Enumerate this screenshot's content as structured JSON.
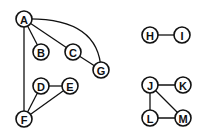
{
  "diagram": {
    "type": "undirected-graph",
    "node_radius": 8,
    "nodes": [
      {
        "id": "A",
        "label": "A",
        "x": 24,
        "y": 19
      },
      {
        "id": "B",
        "label": "B",
        "x": 41,
        "y": 52
      },
      {
        "id": "C",
        "label": "C",
        "x": 73,
        "y": 52
      },
      {
        "id": "G",
        "label": "G",
        "x": 101,
        "y": 70
      },
      {
        "id": "D",
        "label": "D",
        "x": 41,
        "y": 86
      },
      {
        "id": "E",
        "label": "E",
        "x": 70,
        "y": 86
      },
      {
        "id": "F",
        "label": "F",
        "x": 24,
        "y": 119
      },
      {
        "id": "H",
        "label": "H",
        "x": 150,
        "y": 35
      },
      {
        "id": "I",
        "label": "I",
        "x": 182,
        "y": 35
      },
      {
        "id": "J",
        "label": "J",
        "x": 150,
        "y": 85
      },
      {
        "id": "K",
        "label": "K",
        "x": 183,
        "y": 85
      },
      {
        "id": "L",
        "label": "L",
        "x": 150,
        "y": 118
      },
      {
        "id": "M",
        "label": "M",
        "x": 183,
        "y": 118
      }
    ],
    "edges": [
      {
        "from": "A",
        "to": "B"
      },
      {
        "from": "A",
        "to": "C"
      },
      {
        "from": "C",
        "to": "G"
      },
      {
        "from": "A",
        "to": "G",
        "curved": true
      },
      {
        "from": "A",
        "to": "F"
      },
      {
        "from": "D",
        "to": "E"
      },
      {
        "from": "D",
        "to": "F"
      },
      {
        "from": "E",
        "to": "F"
      },
      {
        "from": "H",
        "to": "I"
      },
      {
        "from": "J",
        "to": "K"
      },
      {
        "from": "J",
        "to": "L"
      },
      {
        "from": "J",
        "to": "M"
      },
      {
        "from": "L",
        "to": "M"
      }
    ],
    "colors": {
      "stroke": "#111111",
      "fill": "#ffffff",
      "background": "#ffffff"
    }
  }
}
